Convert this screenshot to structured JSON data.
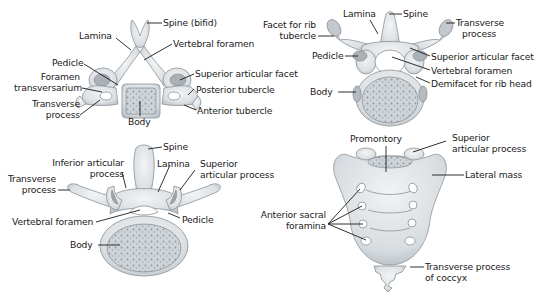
{
  "colors": {
    "bone": "#dfe3e6",
    "bone_shadow": "#a9b0b6",
    "bone_outline": "#8b9298",
    "body_texture": "#b8bec3",
    "leader_line": "#1a1a1a",
    "text": "#1a1a1a",
    "background": "#ffffff"
  },
  "cervical": {
    "name": "cervical-vertebra",
    "labels": {
      "spine": "Spine (bifid)",
      "lamina": "Lamina",
      "vertebral_foramen": "Vertebral foramen",
      "pedicle": "Pedicle",
      "superior_articular_facet": "Superior articular facet",
      "foramen_transversarium_1": "Foramen",
      "foramen_transversarium_2": "transversarium",
      "posterior_tubercle": "Posterior tubercle",
      "transverse_process_1": "Transverse",
      "transverse_process_2": "process",
      "anterior_tubercle": "Anterior tubercle",
      "body": "Body"
    }
  },
  "thoracic": {
    "name": "thoracic-vertebra",
    "labels": {
      "lamina": "Lamina",
      "spine": "Spine",
      "facet_rib_tubercle_1": "Facet for rib",
      "facet_rib_tubercle_2": "tubercle",
      "transverse_process_1": "Transverse",
      "transverse_process_2": "process",
      "pedicle": "Pedicle",
      "superior_articular_facet": "Superior articular facet",
      "vertebral_foramen": "Vertebral foramen",
      "demifacet": "Demifacet for rib head",
      "body": "Body"
    }
  },
  "lumbar": {
    "name": "lumbar-vertebra",
    "labels": {
      "spine": "Spine",
      "inferior_articular_1": "Inferior articular",
      "inferior_articular_2": "process",
      "lamina": "Lamina",
      "superior_articular_1": "Superior",
      "superior_articular_2": "articular process",
      "transverse_process_1": "Transverse",
      "transverse_process_2": "process",
      "vertebral_foramen": "Vertebral foramen",
      "pedicle": "Pedicle",
      "body": "Body"
    }
  },
  "sacrum": {
    "name": "sacrum",
    "labels": {
      "promontory": "Promontory",
      "superior_articular_1": "Superior",
      "superior_articular_2": "articular process",
      "lateral_mass": "Lateral mass",
      "anterior_sacral_1": "Anterior sacral",
      "anterior_sacral_2": "foramina",
      "coccyx_tp_1": "Transverse process",
      "coccyx_tp_2": "of coccyx"
    }
  }
}
